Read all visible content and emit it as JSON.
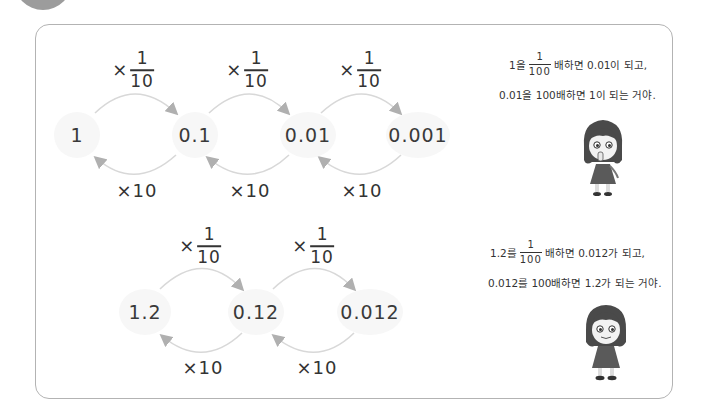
{
  "diagram": {
    "top_row": {
      "nodes": [
        "1",
        "0.1",
        "0.01",
        "0.001"
      ],
      "forward_ops": [
        {
          "times": "×",
          "numerator": "1",
          "denominator": "10"
        },
        {
          "times": "×",
          "numerator": "1",
          "denominator": "10"
        },
        {
          "times": "×",
          "numerator": "1",
          "denominator": "10"
        }
      ],
      "backward_ops": [
        "×10",
        "×10",
        "×10"
      ]
    },
    "bottom_row": {
      "nodes": [
        "1.2",
        "0.12",
        "0.012"
      ],
      "forward_ops": [
        {
          "times": "×",
          "numerator": "1",
          "denominator": "10"
        },
        {
          "times": "×",
          "numerator": "1",
          "denominator": "10"
        }
      ],
      "backward_ops": [
        "×10",
        "×10"
      ]
    }
  },
  "speech": {
    "top": {
      "line1_prefix": "1을",
      "line1_frac_num": "1",
      "line1_frac_den": "100",
      "line1_suffix": "배하면 0.01이 되고,",
      "line2": "0.01을 100배하면 1이 되는 거야."
    },
    "bottom": {
      "line1_prefix": "1.2를",
      "line1_frac_num": "1",
      "line1_frac_den": "100",
      "line1_suffix": "배하면 0.012가 되고,",
      "line2": "0.012를 100배하면 1.2가 되는 거야."
    }
  },
  "colors": {
    "border": "#b3b3b3",
    "node_bg": "#f7f7f7",
    "arc": "#d4d4d4",
    "arrowhead": "#b0b0b0",
    "text": "#333333"
  }
}
